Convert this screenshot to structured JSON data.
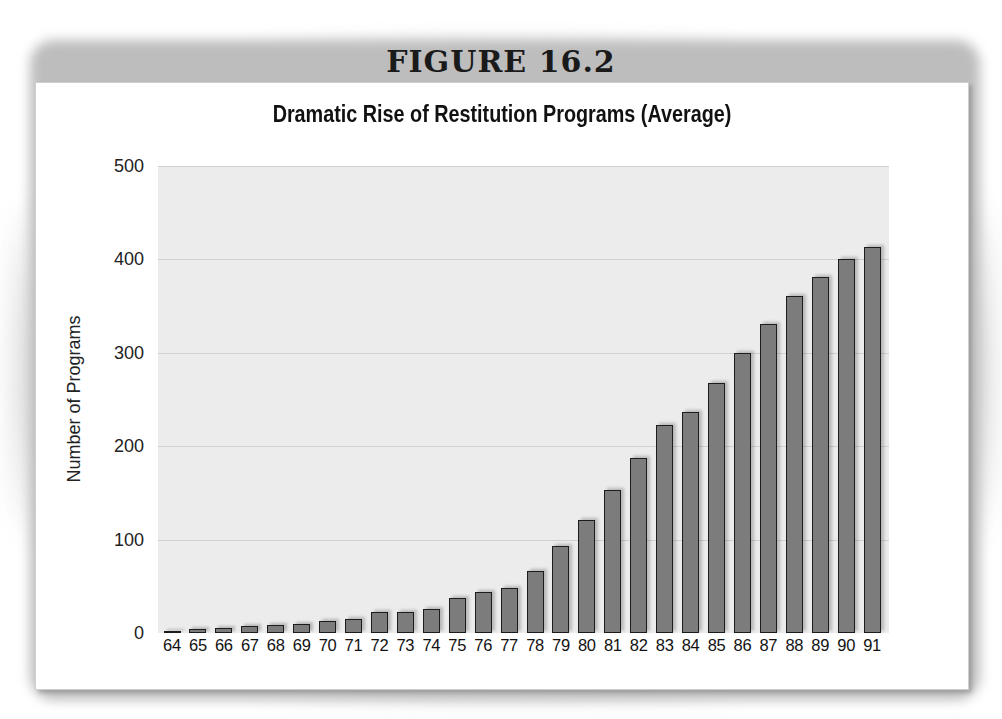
{
  "figure_label": "FIGURE 16.2",
  "chart_data": {
    "type": "bar",
    "title": "Dramatic Rise of Restitution Programs (Average)",
    "xlabel": "",
    "ylabel": "Number of Programs",
    "ylim": [
      0,
      500
    ],
    "yticks": [
      0,
      100,
      200,
      300,
      400,
      500
    ],
    "grid": true,
    "legend": null,
    "categories": [
      "64",
      "65",
      "66",
      "67",
      "68",
      "69",
      "70",
      "71",
      "72",
      "73",
      "74",
      "75",
      "76",
      "77",
      "78",
      "79",
      "80",
      "81",
      "82",
      "83",
      "84",
      "85",
      "86",
      "87",
      "88",
      "89",
      "90",
      "91"
    ],
    "values": [
      2,
      4,
      5,
      7,
      9,
      10,
      13,
      15,
      22,
      23,
      26,
      38,
      44,
      48,
      66,
      93,
      121,
      153,
      187,
      223,
      237,
      268,
      300,
      331,
      361,
      381,
      400,
      413
    ],
    "bar_color": "#7c7c7c",
    "bar_edge_color": "#1c1c1c",
    "plot_background": "#ececec"
  }
}
